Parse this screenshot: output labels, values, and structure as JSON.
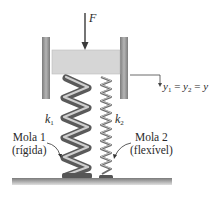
{
  "diagram": {
    "force": {
      "label": "F"
    },
    "springs": [
      {
        "symbol": "k",
        "subscript": "1",
        "name": "Mola 1",
        "description": "(rígida)"
      },
      {
        "symbol": "k",
        "subscript": "2",
        "name": "Mola 2",
        "description": "(flexível)"
      }
    ],
    "displacement": {
      "y1": "y",
      "y1_sub": "1",
      "eq1": " = ",
      "y2": "y",
      "y2_sub": "2",
      "eq2": " = ",
      "y": "y"
    },
    "colors": {
      "block": "#d6d6d6",
      "wall": "#9a9a9a",
      "spring_stiff": "#6e6e6e",
      "spring_stiff_highlight": "#c8c8c8",
      "spring_flex": "#7a7a7a",
      "ground": "#8c8c8c",
      "ink": "#2a2a2a"
    }
  }
}
